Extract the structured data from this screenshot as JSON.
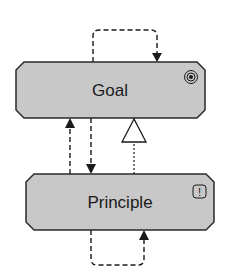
{
  "diagram": {
    "type": "archimate-motivation",
    "colors": {
      "node_fill": "#c8c8c8",
      "node_stroke": "#2a2a2a",
      "edge": "#1a1a1a",
      "background": "#ffffff"
    },
    "nodes": [
      {
        "id": "goal",
        "label": "Goal",
        "icon": "goal-target-icon"
      },
      {
        "id": "principle",
        "label": "Principle",
        "icon": "principle-exclamation-icon",
        "icon_text": "!"
      }
    ],
    "edges": [
      {
        "from": "goal",
        "to": "goal",
        "style": "dashed",
        "arrow": "filled",
        "kind": "self-influence-loop"
      },
      {
        "from": "principle",
        "to": "goal",
        "style": "dashed",
        "arrow": "filled",
        "kind": "influence"
      },
      {
        "from": "goal",
        "to": "principle",
        "style": "dashed",
        "arrow": "filled",
        "kind": "influence"
      },
      {
        "from": "principle",
        "to": "goal",
        "style": "dotted",
        "arrow": "hollow-triangle",
        "kind": "realization"
      },
      {
        "from": "principle",
        "to": "principle",
        "style": "dashed",
        "arrow": "filled",
        "kind": "self-influence-loop"
      }
    ]
  }
}
